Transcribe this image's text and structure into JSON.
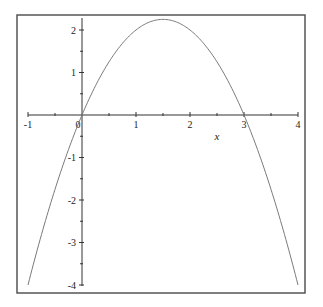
{
  "chart_data": {
    "type": "line",
    "title": "",
    "xlabel": "x",
    "ylabel": "",
    "function": "y = 3x - x^2",
    "xlim": [
      -1,
      4
    ],
    "ylim": [
      -4,
      2.25
    ],
    "grid": false,
    "legend": null,
    "x_ticks": [
      -1,
      0,
      1,
      2,
      3,
      4
    ],
    "x_tick_labels": [
      "-1",
      "0",
      "1",
      "2",
      "3",
      "4"
    ],
    "y_ticks": [
      -4,
      -3,
      -2,
      -1,
      1,
      2
    ],
    "y_tick_labels": [
      "-4",
      "-3",
      "-2",
      "-1",
      "1",
      "2"
    ],
    "minor_tick_step": 0.5,
    "series": [
      {
        "name": "f(x)",
        "x": [
          -1,
          -0.5,
          0,
          0.5,
          1,
          1.5,
          2,
          2.5,
          3,
          3.5,
          4
        ],
        "y": [
          -4,
          -1.75,
          0,
          1.25,
          2,
          2.25,
          2,
          1.25,
          0,
          -1.75,
          -4
        ]
      }
    ],
    "annotations": [],
    "colors": {
      "curve": "#7a7a7a",
      "axes": "#333333",
      "frame": "#555555",
      "background": "#ffffff"
    }
  },
  "layout": {
    "frame": {
      "x0": 17,
      "y0": 15,
      "x1": 305,
      "y1": 293
    },
    "origin_px": {
      "x": 82,
      "y": 115
    },
    "px_per_x": 54,
    "px_per_y": 42.5,
    "x_axis_extent_px": [
      28,
      298
    ],
    "y_axis_extent_px": [
      18,
      286
    ]
  }
}
